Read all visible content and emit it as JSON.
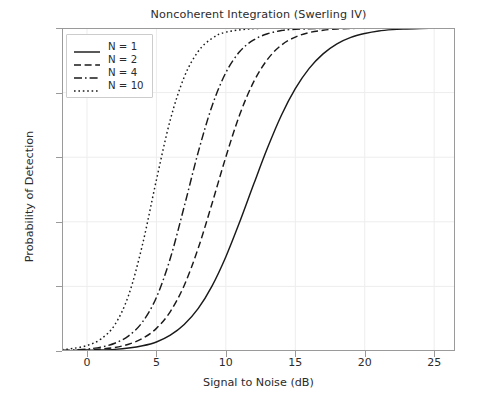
{
  "chart_data": {
    "type": "line",
    "title": "Noncoherent Integration (Swerling IV)",
    "xlabel": "Signal to Noise (dB)",
    "ylabel": "Probability of Detection",
    "xlim": [
      -1.8,
      26.5
    ],
    "ylim": [
      0.0,
      1.0
    ],
    "xticks": [
      0,
      5,
      10,
      15,
      20,
      25
    ],
    "xtick_labels": [
      "0",
      "5",
      "10",
      "15",
      "20",
      "25"
    ],
    "yticks": [
      0.0,
      0.2,
      0.4,
      0.6,
      0.8,
      1.0
    ],
    "ytick_labels": [
      "0.0",
      "0.2",
      "0.4",
      "0.6",
      "0.8",
      "1.0"
    ],
    "grid": true,
    "grid_color": "#ededed",
    "legend_position": "upper left",
    "line_color": "#1a1a1a",
    "series": [
      {
        "name": "N = 1",
        "dash": "solid",
        "midpoint_db": 11.6,
        "x": [
          -1.8,
          -1,
          0,
          1,
          2,
          3,
          4,
          5,
          6,
          7,
          8,
          9,
          10,
          11,
          12,
          13,
          14,
          15,
          16,
          17,
          18,
          19,
          20,
          21,
          22,
          23,
          24,
          25,
          26.5
        ],
        "y": [
          0.001,
          0.001,
          0.002,
          0.003,
          0.005,
          0.009,
          0.016,
          0.028,
          0.049,
          0.082,
          0.131,
          0.201,
          0.292,
          0.4,
          0.516,
          0.629,
          0.73,
          0.812,
          0.875,
          0.92,
          0.951,
          0.971,
          0.983,
          0.991,
          0.995,
          0.997,
          0.9985,
          0.999,
          0.9995
        ]
      },
      {
        "name": "N = 2",
        "dash": "dashed",
        "midpoint_db": 9.0,
        "x": [
          -1.8,
          -1,
          0,
          1,
          2,
          3,
          4,
          5,
          6,
          7,
          8,
          9,
          10,
          11,
          12,
          13,
          14,
          15,
          16,
          17,
          18,
          19,
          20,
          22,
          25,
          26.5
        ],
        "y": [
          0.001,
          0.002,
          0.003,
          0.006,
          0.011,
          0.021,
          0.039,
          0.07,
          0.122,
          0.203,
          0.317,
          0.456,
          0.601,
          0.732,
          0.833,
          0.903,
          0.947,
          0.972,
          0.986,
          0.993,
          0.997,
          0.9985,
          0.9993,
          0.9998,
          0.99995,
          0.99995
        ]
      },
      {
        "name": "N = 4",
        "dash": "dashdot",
        "midpoint_db": 6.4,
        "x": [
          -1.8,
          -1,
          0,
          1,
          2,
          3,
          4,
          5,
          6,
          7,
          8,
          9,
          10,
          11,
          12,
          13,
          14,
          15,
          18,
          22,
          25,
          26.5
        ],
        "y": [
          0.002,
          0.003,
          0.006,
          0.012,
          0.024,
          0.047,
          0.09,
          0.166,
          0.287,
          0.447,
          0.614,
          0.758,
          0.862,
          0.927,
          0.963,
          0.982,
          0.992,
          0.996,
          0.9995,
          0.99995,
          0.99999,
          0.99999
        ]
      },
      {
        "name": "N = 10",
        "dash": "dotted",
        "midpoint_db": 3.5,
        "x": [
          -1.8,
          -1,
          0,
          1,
          2,
          3,
          4,
          5,
          6,
          7,
          8,
          9,
          10,
          12,
          15,
          20,
          25,
          26.5
        ],
        "y": [
          0.004,
          0.008,
          0.017,
          0.037,
          0.081,
          0.173,
          0.33,
          0.53,
          0.716,
          0.848,
          0.927,
          0.968,
          0.987,
          0.998,
          0.9999,
          0.99999,
          0.99999,
          0.99999
        ]
      }
    ]
  },
  "legend": {
    "items": [
      {
        "label": "N = 1"
      },
      {
        "label": "N = 2"
      },
      {
        "label": "N = 4"
      },
      {
        "label": "N = 10"
      }
    ]
  }
}
